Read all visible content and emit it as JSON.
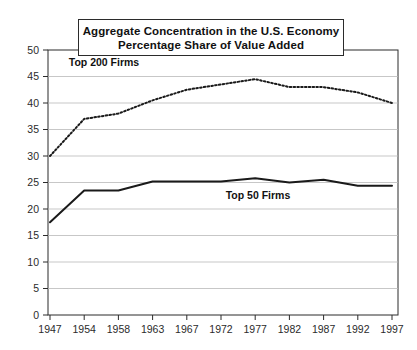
{
  "chart_data": {
    "type": "line",
    "title": "Aggregate Concentration in the U.S. Economy\nPercentage Share of Value Added",
    "title_line1": "Aggregate Concentration in the U.S. Economy",
    "title_line2": "Percentage Share of Value Added",
    "xlabel": "",
    "ylabel": "",
    "ylim": [
      0,
      50
    ],
    "yticks": [
      0,
      5,
      10,
      15,
      20,
      25,
      30,
      35,
      40,
      45,
      50
    ],
    "grid": "horizontal",
    "legend": "inline-labels",
    "categories": [
      "1947",
      "1954",
      "1958",
      "1963",
      "1967",
      "1972",
      "1977",
      "1982",
      "1987",
      "1992",
      "1997"
    ],
    "x_tick_labels": [
      "1947",
      "1954",
      "1958",
      "1963",
      "1967",
      "1972",
      "1977",
      "1982",
      "1987",
      "1992",
      "1997"
    ],
    "series": [
      {
        "name": "Top 200 Firms",
        "style": "dotted",
        "color": "#1a1a1a",
        "label_text": "Top 200 Firms",
        "values": [
          30.0,
          37.0,
          38.0,
          40.5,
          42.5,
          43.5,
          44.5,
          43.0,
          43.0,
          42.0,
          40.0
        ]
      },
      {
        "name": "Top 50 Firms",
        "style": "solid",
        "color": "#1a1a1a",
        "label_text": "Top 50 Firms",
        "values": [
          17.5,
          23.5,
          23.5,
          25.2,
          25.2,
          25.2,
          25.8,
          25.0,
          25.5,
          24.4,
          24.4
        ]
      }
    ],
    "annotations": [
      {
        "text": "Top 200 Firms",
        "x_frac": 0.16,
        "value": 47.0
      },
      {
        "text": "Top 50 Firms",
        "x_frac": 0.6,
        "value": 21.8
      }
    ]
  },
  "colors": {
    "axis": "#2b2b2b",
    "grid": "#b9b9b9",
    "series_ink": "#1a1a1a",
    "background": "#ffffff"
  }
}
